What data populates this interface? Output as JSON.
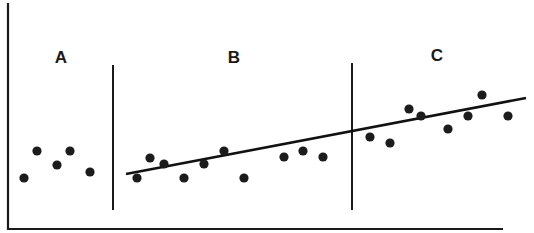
{
  "chart_data": {
    "type": "scatter",
    "title": "",
    "xlabel": "",
    "ylabel": "",
    "grid": false,
    "legend": null,
    "note": "Unlabeled axes; values are pixel-derived positions (x: left→right, y: height above x-axis).",
    "segments": [
      {
        "label": "A",
        "points": [
          {
            "x": 24,
            "y": 51
          },
          {
            "x": 37,
            "y": 78
          },
          {
            "x": 57,
            "y": 64
          },
          {
            "x": 70,
            "y": 78
          },
          {
            "x": 90,
            "y": 57
          }
        ]
      },
      {
        "label": "B",
        "points": [
          {
            "x": 137,
            "y": 51
          },
          {
            "x": 150,
            "y": 71
          },
          {
            "x": 164,
            "y": 65
          },
          {
            "x": 184,
            "y": 51
          },
          {
            "x": 204,
            "y": 65
          },
          {
            "x": 224,
            "y": 78
          },
          {
            "x": 244,
            "y": 51
          },
          {
            "x": 284,
            "y": 72
          },
          {
            "x": 303,
            "y": 78
          },
          {
            "x": 323,
            "y": 72
          }
        ]
      },
      {
        "label": "C",
        "points": [
          {
            "x": 370,
            "y": 92
          },
          {
            "x": 390,
            "y": 86
          },
          {
            "x": 409,
            "y": 120
          },
          {
            "x": 421,
            "y": 113
          },
          {
            "x": 448,
            "y": 100
          },
          {
            "x": 468,
            "y": 113
          },
          {
            "x": 482,
            "y": 134
          },
          {
            "x": 508,
            "y": 113
          }
        ]
      }
    ],
    "dividers_x": [
      113,
      352
    ],
    "trend_line": {
      "x1": 126,
      "y1": 55,
      "x2": 526,
      "y2": 131
    },
    "axes": {
      "origin_x": 8,
      "origin_y": 229,
      "x_end": 503,
      "y_top": 3
    }
  },
  "labels": {
    "segment_a": "A",
    "segment_b": "B",
    "segment_c": "C"
  }
}
